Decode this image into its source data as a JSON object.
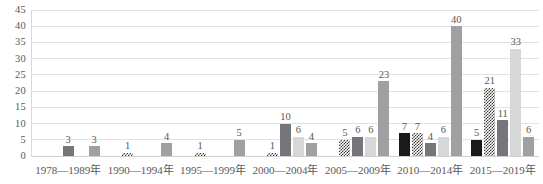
{
  "chart_data": {
    "type": "bar",
    "title": "",
    "subtitle": "",
    "xlabel": "",
    "ylabel": "",
    "ylim": [
      0,
      45
    ],
    "y_ticks": [
      0,
      5,
      10,
      15,
      20,
      25,
      30,
      35,
      40,
      45
    ],
    "grid": true,
    "legend_position": "none",
    "categories": [
      "1978—1989年",
      "1990—1994年",
      "1995—1999年",
      "2000—2004年",
      "2005—2009年",
      "2010—2014年",
      "2015—2019年"
    ],
    "series": [
      {
        "name": "series-1",
        "pattern": "solid-black",
        "color": "#1a1a1a",
        "values": [
          null,
          null,
          null,
          null,
          null,
          7,
          5
        ]
      },
      {
        "name": "series-2",
        "pattern": "checkerboard",
        "color": "#3c3c3c",
        "values": [
          null,
          1,
          1,
          1,
          5,
          7,
          21
        ]
      },
      {
        "name": "series-3",
        "pattern": "solid-dark-gray",
        "color": "#76767a",
        "values": [
          3,
          null,
          null,
          10,
          6,
          4,
          11
        ]
      },
      {
        "name": "series-4",
        "pattern": "solid-light-gray",
        "color": "#d7d7d7",
        "values": [
          null,
          null,
          null,
          6,
          6,
          6,
          33
        ]
      },
      {
        "name": "series-5",
        "pattern": "solid-medium-gray",
        "color": "#a0a0a2",
        "values": [
          3,
          4,
          5,
          4,
          23,
          40,
          6
        ]
      }
    ]
  }
}
